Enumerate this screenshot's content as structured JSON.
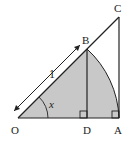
{
  "diagram": {
    "labels": {
      "O": "O",
      "D": "D",
      "A": "A",
      "B": "B",
      "C": "C"
    },
    "length_label": "1",
    "angle_label": "x",
    "colors": {
      "shade": "#c8c8c8",
      "stroke": "#222222"
    }
  }
}
